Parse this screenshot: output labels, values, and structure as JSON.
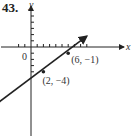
{
  "problem_number": "43.",
  "chart_data": {
    "type": "line",
    "title": "",
    "xlabel": "x",
    "ylabel": "y",
    "origin_label": "0",
    "xlim": [
      -5,
      15
    ],
    "ylim": [
      -15,
      7
    ],
    "grid": false,
    "series": [
      {
        "name": "line",
        "x": [
          -5,
          9
        ],
        "y": [
          -8.75,
          1.75
        ],
        "arrows": "both"
      }
    ],
    "points": [
      {
        "x": 2,
        "y": -4,
        "label": "(2, −4)"
      },
      {
        "x": 6,
        "y": -1,
        "label": "(6, −1)"
      }
    ]
  }
}
